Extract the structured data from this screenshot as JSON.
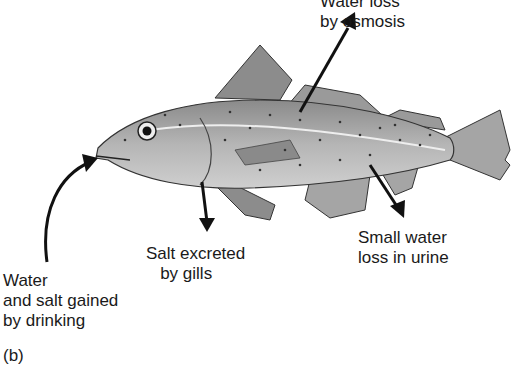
{
  "figure": {
    "panel_label": "(b)",
    "labels": {
      "water_loss": "Water loss\nby osmosis",
      "salt_excreted": "Salt excreted\n   by gills",
      "urine": "Small water\nloss in urine",
      "drinking": "Water\nand salt gained\nby drinking"
    },
    "colors": {
      "fish_body": "#9a9a9a",
      "fish_dark": "#555555",
      "arrow": "#111111"
    }
  }
}
